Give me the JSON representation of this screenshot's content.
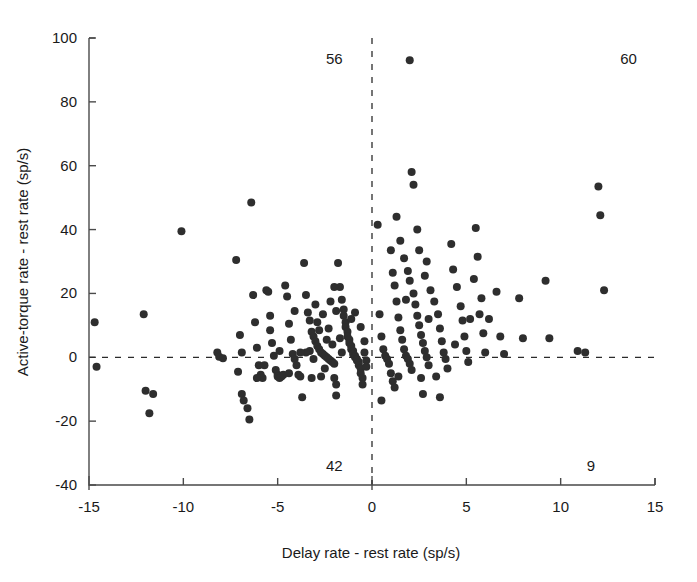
{
  "chart_data": {
    "type": "scatter",
    "title": "",
    "xlabel": "Delay rate - rest rate  (sp/s)",
    "ylabel": "Active-torque rate - rest rate  (sp/s)",
    "xlim": [
      -15,
      15
    ],
    "ylim": [
      -40,
      100
    ],
    "xticks": [
      -15,
      -10,
      -5,
      0,
      5,
      10,
      15
    ],
    "xtick_labels": [
      "-15",
      "-10",
      "-5",
      "0",
      "5",
      "10",
      "15"
    ],
    "yticks": [
      -40,
      -20,
      0,
      20,
      40,
      60,
      80,
      100
    ],
    "ytick_labels": [
      "-40",
      "-20",
      "0",
      "20",
      "40",
      "60",
      "80",
      "100"
    ],
    "grid": false,
    "legend": null,
    "reference_lines": [
      {
        "orientation": "vertical",
        "value": 0,
        "style": "dashed"
      },
      {
        "orientation": "horizontal",
        "value": 0,
        "style": "dashed"
      }
    ],
    "quadrant_counts": [
      {
        "label": "56",
        "quadrant": "top-left",
        "x": -2.0,
        "y": 93.5
      },
      {
        "label": "60",
        "quadrant": "top-right",
        "x": 13.6,
        "y": 93.5
      },
      {
        "label": "42",
        "quadrant": "bottom-left",
        "x": -2.0,
        "y": -34.0
      },
      {
        "label": "9",
        "quadrant": "bottom-right",
        "x": 11.6,
        "y": -34.0
      }
    ],
    "marker": {
      "shape": "circle",
      "color": "#2e2e2e",
      "size": 7
    },
    "points": [
      [
        -14.7,
        11.0
      ],
      [
        -14.6,
        -3.0
      ],
      [
        -12.1,
        13.5
      ],
      [
        -12.0,
        -10.5
      ],
      [
        -11.6,
        -11.5
      ],
      [
        -11.8,
        -17.5
      ],
      [
        -10.1,
        39.5
      ],
      [
        -8.2,
        1.5
      ],
      [
        -8.1,
        0.2
      ],
      [
        -7.9,
        -0.3
      ],
      [
        -7.2,
        30.5
      ],
      [
        -7.0,
        7.0
      ],
      [
        -6.9,
        1.5
      ],
      [
        -7.1,
        -4.5
      ],
      [
        -6.9,
        -11.5
      ],
      [
        -6.8,
        -13.5
      ],
      [
        -6.6,
        -16.0
      ],
      [
        -6.5,
        -19.5
      ],
      [
        -6.4,
        48.5
      ],
      [
        -6.3,
        19.5
      ],
      [
        -6.2,
        11.0
      ],
      [
        -6.1,
        3.0
      ],
      [
        -6.0,
        -2.5
      ],
      [
        -5.9,
        -5.5
      ],
      [
        -5.8,
        -6.5
      ],
      [
        -5.6,
        21.0
      ],
      [
        -5.5,
        20.5
      ],
      [
        -5.4,
        13.0
      ],
      [
        -5.3,
        4.5
      ],
      [
        -5.2,
        0.5
      ],
      [
        -5.1,
        -4.0
      ],
      [
        -5.0,
        -5.5
      ],
      [
        -5.0,
        -6.0
      ],
      [
        -4.9,
        -6.5
      ],
      [
        -4.8,
        -6.0
      ],
      [
        -4.7,
        -5.5
      ],
      [
        -4.6,
        22.5
      ],
      [
        -4.5,
        19.0
      ],
      [
        -4.4,
        10.5
      ],
      [
        -4.3,
        5.5
      ],
      [
        -4.2,
        1.0
      ],
      [
        -4.1,
        -0.5
      ],
      [
        -4.0,
        -2.5
      ],
      [
        -3.9,
        -5.5
      ],
      [
        -3.8,
        -6.0
      ],
      [
        -3.7,
        -12.5
      ],
      [
        -3.6,
        29.5
      ],
      [
        -3.5,
        19.5
      ],
      [
        -3.4,
        14.0
      ],
      [
        -3.3,
        11.5
      ],
      [
        -3.2,
        8.0
      ],
      [
        -3.1,
        6.5
      ],
      [
        -3.0,
        5.0
      ],
      [
        -2.9,
        3.5
      ],
      [
        -2.8,
        2.5
      ],
      [
        -2.7,
        1.5
      ],
      [
        -2.6,
        1.0
      ],
      [
        -2.5,
        0.5
      ],
      [
        -2.4,
        0.0
      ],
      [
        -2.3,
        -0.5
      ],
      [
        -2.2,
        -1.0
      ],
      [
        -2.1,
        -1.5
      ],
      [
        -2.0,
        -2.0
      ],
      [
        -2.0,
        -6.5
      ],
      [
        -1.9,
        -8.5
      ],
      [
        -1.9,
        -12.0
      ],
      [
        -1.8,
        29.5
      ],
      [
        -1.7,
        22.0
      ],
      [
        -1.6,
        18.0
      ],
      [
        -1.5,
        15.0
      ],
      [
        -1.5,
        13.0
      ],
      [
        -1.4,
        11.0
      ],
      [
        -1.4,
        9.5
      ],
      [
        -1.3,
        8.0
      ],
      [
        -1.3,
        6.5
      ],
      [
        -1.2,
        5.5
      ],
      [
        -1.2,
        4.5
      ],
      [
        -1.1,
        3.5
      ],
      [
        -1.1,
        2.5
      ],
      [
        -1.0,
        2.0
      ],
      [
        -1.0,
        1.0
      ],
      [
        -0.9,
        0.5
      ],
      [
        -0.9,
        0.0
      ],
      [
        -0.8,
        -0.5
      ],
      [
        -0.8,
        -1.0
      ],
      [
        -0.7,
        -1.5
      ],
      [
        -0.7,
        -2.5
      ],
      [
        -0.6,
        -3.5
      ],
      [
        -0.6,
        -5.0
      ],
      [
        -0.5,
        -6.5
      ],
      [
        -0.5,
        -8.5
      ],
      [
        -2.6,
        13.5
      ],
      [
        -3.0,
        16.5
      ],
      [
        -2.2,
        17.5
      ],
      [
        -1.7,
        6.0
      ],
      [
        -2.4,
        5.5
      ],
      [
        -2.8,
        8.5
      ],
      [
        -3.3,
        2.0
      ],
      [
        -2.1,
        4.0
      ],
      [
        -1.6,
        1.5
      ],
      [
        -2.5,
        -3.5
      ],
      [
        -3.1,
        -0.5
      ],
      [
        -3.5,
        1.5
      ],
      [
        -4.1,
        14.5
      ],
      [
        -2.9,
        11.0
      ],
      [
        -1.9,
        14.5
      ],
      [
        -2.3,
        9.0
      ],
      [
        -0.9,
        14.0
      ],
      [
        -1.1,
        12.0
      ],
      [
        -0.6,
        9.5
      ],
      [
        -0.4,
        5.0
      ],
      [
        -0.4,
        1.5
      ],
      [
        -0.3,
        -1.0
      ],
      [
        -0.3,
        -3.0
      ],
      [
        -2.7,
        -6.0
      ],
      [
        -3.2,
        -6.5
      ],
      [
        -3.8,
        1.5
      ],
      [
        -4.4,
        -5.0
      ],
      [
        -5.7,
        -2.5
      ],
      [
        -6.1,
        -6.5
      ],
      [
        -4.9,
        2.0
      ],
      [
        -5.4,
        8.5
      ],
      [
        -2.0,
        22.0
      ],
      [
        0.3,
        41.5
      ],
      [
        0.4,
        13.5
      ],
      [
        0.5,
        6.5
      ],
      [
        0.6,
        2.5
      ],
      [
        0.7,
        0.5
      ],
      [
        0.8,
        -0.5
      ],
      [
        0.9,
        -2.0
      ],
      [
        1.0,
        -5.0
      ],
      [
        1.1,
        -7.5
      ],
      [
        1.2,
        -9.5
      ],
      [
        0.5,
        -13.5
      ],
      [
        1.0,
        33.5
      ],
      [
        1.1,
        26.5
      ],
      [
        1.2,
        22.5
      ],
      [
        1.3,
        17.5
      ],
      [
        1.4,
        12.5
      ],
      [
        1.5,
        8.5
      ],
      [
        1.6,
        5.5
      ],
      [
        1.7,
        2.5
      ],
      [
        1.8,
        0.5
      ],
      [
        1.9,
        -0.5
      ],
      [
        2.0,
        -2.0
      ],
      [
        2.1,
        -4.0
      ],
      [
        2.0,
        93.0
      ],
      [
        2.1,
        58.0
      ],
      [
        2.2,
        54.0
      ],
      [
        1.5,
        36.5
      ],
      [
        1.7,
        31.0
      ],
      [
        1.9,
        27.0
      ],
      [
        2.0,
        24.0
      ],
      [
        2.2,
        20.0
      ],
      [
        2.3,
        16.5
      ],
      [
        2.4,
        13.0
      ],
      [
        2.5,
        10.0
      ],
      [
        2.6,
        7.0
      ],
      [
        2.7,
        4.5
      ],
      [
        2.8,
        2.0
      ],
      [
        2.9,
        0.0
      ],
      [
        3.0,
        -2.5
      ],
      [
        2.7,
        -11.5
      ],
      [
        2.5,
        33.5
      ],
      [
        2.8,
        25.5
      ],
      [
        3.1,
        21.0
      ],
      [
        3.3,
        17.5
      ],
      [
        3.5,
        13.5
      ],
      [
        3.6,
        9.0
      ],
      [
        3.7,
        5.0
      ],
      [
        3.8,
        1.5
      ],
      [
        3.9,
        -0.5
      ],
      [
        4.0,
        -3.5
      ],
      [
        3.6,
        -12.5
      ],
      [
        4.2,
        35.5
      ],
      [
        4.3,
        27.5
      ],
      [
        4.5,
        22.0
      ],
      [
        4.7,
        16.0
      ],
      [
        4.8,
        11.5
      ],
      [
        4.9,
        6.5
      ],
      [
        5.0,
        2.0
      ],
      [
        5.1,
        -1.5
      ],
      [
        5.5,
        40.5
      ],
      [
        5.6,
        31.5
      ],
      [
        5.4,
        24.5
      ],
      [
        5.8,
        18.5
      ],
      [
        5.7,
        13.5
      ],
      [
        5.9,
        7.5
      ],
      [
        6.0,
        1.5
      ],
      [
        6.6,
        20.5
      ],
      [
        6.8,
        6.5
      ],
      [
        7.0,
        1.0
      ],
      [
        7.8,
        18.5
      ],
      [
        8.0,
        6.0
      ],
      [
        9.2,
        24.0
      ],
      [
        9.4,
        6.0
      ],
      [
        10.9,
        2.0
      ],
      [
        11.3,
        1.5
      ],
      [
        12.0,
        53.5
      ],
      [
        12.1,
        44.5
      ],
      [
        12.3,
        21.0
      ],
      [
        1.3,
        44.0
      ],
      [
        2.4,
        40.0
      ],
      [
        3.0,
        12.0
      ],
      [
        4.4,
        4.0
      ],
      [
        1.8,
        18.0
      ],
      [
        2.6,
        -6.5
      ],
      [
        3.4,
        -6.0
      ],
      [
        1.4,
        -6.0
      ],
      [
        2.9,
        30.0
      ],
      [
        5.2,
        12.0
      ],
      [
        6.2,
        12.0
      ]
    ]
  }
}
